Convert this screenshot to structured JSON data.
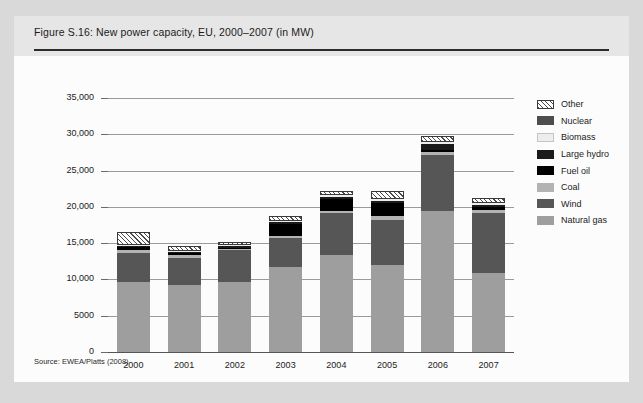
{
  "figure": {
    "title": "Figure S.16: New power capacity, EU, 2000–2007 (in MW)",
    "source": "Source: EWEA/Platts (2008)"
  },
  "legend": {
    "position": "right",
    "items": [
      {
        "label": "Other",
        "color": "#ffffff",
        "pattern": "diagonal-hatch"
      },
      {
        "label": "Nuclear",
        "color": "#4d4d4d",
        "pattern": "solid"
      },
      {
        "label": "Biomass",
        "color": "#ededed",
        "pattern": "solid"
      },
      {
        "label": "Large hydro",
        "color": "#1a1a1a",
        "pattern": "solid"
      },
      {
        "label": "Fuel oil",
        "color": "#000000",
        "pattern": "solid"
      },
      {
        "label": "Coal",
        "color": "#b3b3b3",
        "pattern": "solid"
      },
      {
        "label": "Wind",
        "color": "#565656",
        "pattern": "solid"
      },
      {
        "label": "Natural gas",
        "color": "#9e9e9e",
        "pattern": "solid"
      }
    ]
  },
  "chart_data": {
    "type": "bar",
    "stacked": true,
    "title": "Figure S.16: New power capacity, EU, 2000–2007 (in MW)",
    "xlabel": "",
    "ylabel": "",
    "unit": "MW",
    "grid": true,
    "ylim": [
      0,
      35000
    ],
    "yticks": [
      0,
      5000,
      10000,
      15000,
      20000,
      25000,
      30000,
      35000
    ],
    "ytick_labels": [
      "0",
      "5000",
      "10,000",
      "15,000",
      "20,000",
      "25,000",
      "30,000",
      "35,000"
    ],
    "categories": [
      "2000",
      "2001",
      "2002",
      "2003",
      "2004",
      "2005",
      "2006",
      "2007"
    ],
    "series": [
      {
        "name": "Natural gas",
        "color": "#9e9e9e",
        "values": [
          9700,
          9300,
          9600,
          11700,
          13300,
          12000,
          19400,
          10900
        ]
      },
      {
        "name": "Wind",
        "color": "#565656",
        "values": [
          3900,
          3700,
          4400,
          4000,
          5800,
          6200,
          7700,
          8300
        ]
      },
      {
        "name": "Coal",
        "color": "#b3b3b3",
        "values": [
          500,
          400,
          250,
          350,
          350,
          500,
          400,
          350
        ]
      },
      {
        "name": "Fuel oil",
        "color": "#000000",
        "values": [
          400,
          300,
          150,
          1600,
          1700,
          1900,
          300,
          450
        ]
      },
      {
        "name": "Large hydro",
        "color": "#1a1a1a",
        "values": [
          150,
          100,
          150,
          250,
          250,
          250,
          900,
          250
        ]
      },
      {
        "name": "Biomass",
        "color": "#ededed",
        "values": [
          150,
          150,
          150,
          150,
          250,
          300,
          300,
          300
        ]
      },
      {
        "name": "Nuclear",
        "color": "#4d4d4d",
        "values": [
          0,
          0,
          0,
          0,
          0,
          0,
          0,
          0
        ]
      },
      {
        "name": "Other",
        "color": "#ffffff",
        "pattern": "diagonal-hatch",
        "values": [
          1700,
          700,
          500,
          650,
          600,
          1000,
          800,
          700
        ]
      }
    ],
    "totals": [
      16500,
      14650,
      15200,
      18700,
      22250,
      22150,
      29800,
      21250
    ]
  },
  "axis": {
    "x_labels": [
      "2000",
      "2001",
      "2002",
      "2003",
      "2004",
      "2005",
      "2006",
      "2007"
    ]
  }
}
